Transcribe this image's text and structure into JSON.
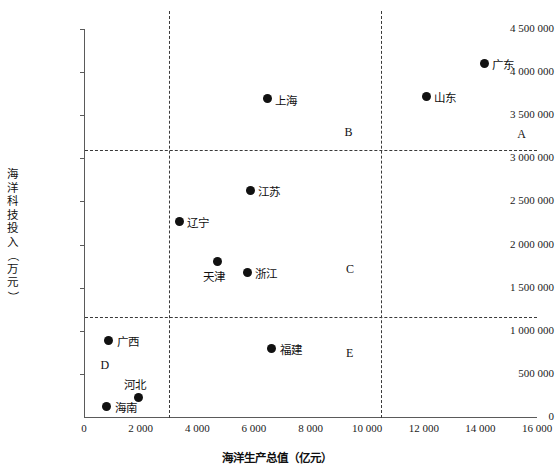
{
  "chart_data": {
    "type": "scatter",
    "title": "",
    "xlabel": "海洋生产总值（亿元）",
    "ylabel": "海洋科技投入（万元）",
    "xlim": [
      0,
      16000
    ],
    "ylim": [
      0,
      4500000
    ],
    "xticks": [
      "0",
      "2 000",
      "4 000",
      "6 000",
      "8 000",
      "10 000",
      "12 000",
      "14 000",
      "16 000"
    ],
    "xtick_values": [
      0,
      2000,
      4000,
      6000,
      8000,
      10000,
      12000,
      14000,
      16000
    ],
    "yticks": [
      "0",
      "500 000",
      "1 000 000",
      "1 500 000",
      "2 000 000",
      "2 500 000",
      "3 000 000",
      "3 500 000",
      "4 000 000",
      "4 500 000"
    ],
    "ytick_values": [
      0,
      500000,
      1000000,
      1500000,
      2000000,
      2500000,
      3000000,
      3500000,
      4000000,
      4500000
    ],
    "grid": false,
    "legend": "none",
    "points": [
      {
        "label": "广东",
        "x": 14130,
        "y": 4100000,
        "label_side": "right"
      },
      {
        "label": "山东",
        "x": 12090,
        "y": 3720000,
        "label_side": "right"
      },
      {
        "label": "上海",
        "x": 6470,
        "y": 3690000,
        "label_side": "right"
      },
      {
        "label": "江苏",
        "x": 5870,
        "y": 2630000,
        "label_side": "right"
      },
      {
        "label": "辽宁",
        "x": 3360,
        "y": 2270000,
        "label_side": "right"
      },
      {
        "label": "天津",
        "x": 4700,
        "y": 1800000,
        "label_side": "below"
      },
      {
        "label": "浙江",
        "x": 5760,
        "y": 1680000,
        "label_side": "right"
      },
      {
        "label": "广西",
        "x": 880,
        "y": 890000,
        "label_side": "right"
      },
      {
        "label": "福建",
        "x": 6640,
        "y": 800000,
        "label_side": "right"
      },
      {
        "label": "河北",
        "x": 1910,
        "y": 230000,
        "label_side": "above"
      },
      {
        "label": "海南",
        "x": 810,
        "y": 125000,
        "label_side": "right"
      }
    ],
    "reference_lines": {
      "vertical": [
        3000,
        10500
      ],
      "horizontal": [
        3100000,
        1160000
      ]
    },
    "quadrant_labels": [
      {
        "text": "A",
        "x": 15300,
        "y": 3280000
      },
      {
        "text": "B",
        "x": 9200,
        "y": 3300000
      },
      {
        "text": "C",
        "x": 9250,
        "y": 1720000
      },
      {
        "text": "D",
        "x": 580,
        "y": 600000
      },
      {
        "text": "E",
        "x": 9250,
        "y": 740000
      }
    ]
  }
}
